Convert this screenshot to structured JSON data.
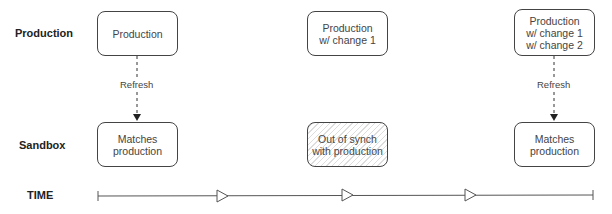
{
  "rows": {
    "production_label": "Production",
    "sandbox_label": "Sandbox",
    "time_label": "TIME"
  },
  "columns": [
    {
      "production": "Production",
      "sandbox": "Matches\nproduction",
      "sandbox_state": "in-sync",
      "refresh_label": "Refresh"
    },
    {
      "production": "Production\nw/ change 1",
      "sandbox": "Out of synch\nwith production",
      "sandbox_state": "out-of-sync"
    },
    {
      "production": "Production\nw/ change 1\nw/ change 2",
      "sandbox": "Matches\nproduction",
      "sandbox_state": "in-sync",
      "refresh_label": "Refresh"
    }
  ],
  "timeline": {
    "arrow_count": 3
  },
  "colors": {
    "stroke": "#444444",
    "hatch": "#dddddd",
    "text": "#444444"
  }
}
